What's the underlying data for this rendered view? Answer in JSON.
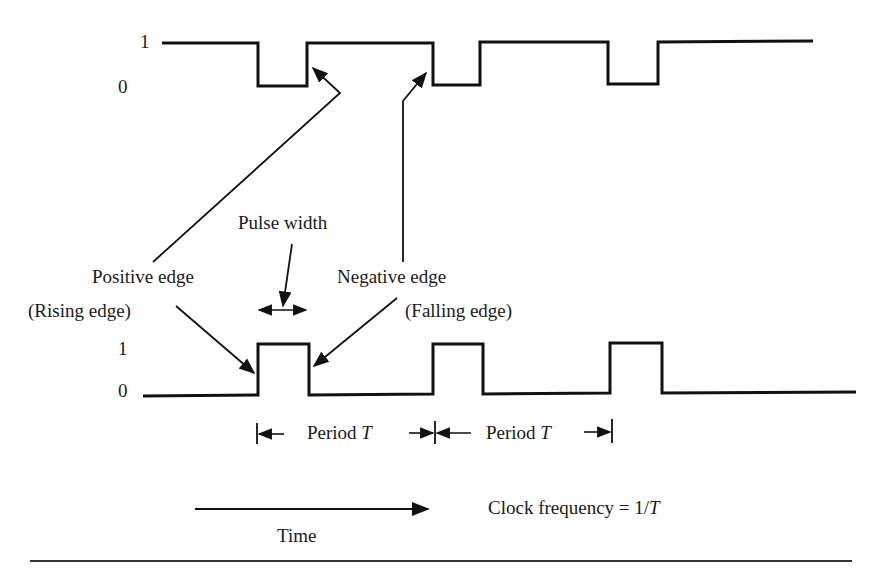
{
  "diagram": {
    "top_waveform": {
      "label_high": "1",
      "label_low": "0"
    },
    "bottom_waveform": {
      "label_high": "1",
      "label_low": "0"
    },
    "annotations": {
      "pulse_width": "Pulse width",
      "positive_edge": "Positive edge",
      "rising_edge": "(Rising edge)",
      "negative_edge": "Negative edge",
      "falling_edge": "(Falling edge)",
      "period_1_prefix": "Period ",
      "period_1_var": "T",
      "period_2_prefix": "Period ",
      "period_2_var": "T",
      "time": "Time",
      "clock_frequency_prefix": "Clock frequency = 1/",
      "clock_frequency_var": "T"
    },
    "colors": {
      "line": "#111111",
      "background": "#ffffff"
    }
  }
}
